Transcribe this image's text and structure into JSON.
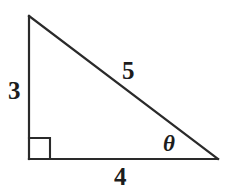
{
  "figure": {
    "kind": "right-triangle-diagram",
    "background_color": "#ffffff",
    "stroke_color": "#2a2a2a",
    "stroke_width": 2.2,
    "width": 226,
    "height": 194
  },
  "labels": {
    "vertical_leg": "3",
    "hypotenuse": "5",
    "base_leg": "4",
    "angle": "θ"
  },
  "geometry": {
    "vertices": {
      "apex": {
        "x": 29,
        "y": 16
      },
      "right_angle": {
        "x": 29,
        "y": 159
      },
      "angle_theta": {
        "x": 218,
        "y": 159
      }
    },
    "right_angle_marker": {
      "x": 29,
      "y": 138,
      "size": 21
    }
  },
  "chart_data": {
    "type": "diagram",
    "title": "",
    "shape": "right triangle",
    "sides": [
      {
        "name": "vertical leg (opposite)",
        "label": "3",
        "value": 3,
        "from": "apex",
        "to": "right_angle"
      },
      {
        "name": "base leg (adjacent)",
        "label": "4",
        "value": 4,
        "from": "right_angle",
        "to": "angle_theta"
      },
      {
        "name": "hypotenuse",
        "label": "5",
        "value": 5,
        "from": "apex",
        "to": "angle_theta"
      }
    ],
    "angles": [
      {
        "name": "right angle",
        "label": "",
        "value": 90,
        "at": "right_angle",
        "marker": "square"
      },
      {
        "name": "theta",
        "label": "θ",
        "at": "angle_theta"
      }
    ]
  }
}
